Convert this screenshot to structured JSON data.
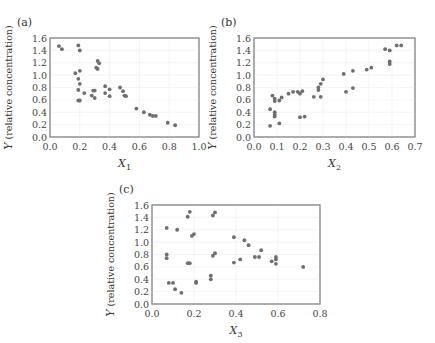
{
  "chart_data": [
    {
      "panel_label": "(a)",
      "type": "scatter",
      "title": "",
      "xlabel": "X",
      "xlabel_sub": "1",
      "ylabel": "Y (relative concentration)",
      "xlim": [
        0.0,
        1.0
      ],
      "ylim": [
        0.0,
        1.6
      ],
      "xticks": [
        "0.0",
        "0.2",
        "0.4",
        "0.6",
        "0.8",
        "1.0"
      ],
      "yticks": [
        "0.0",
        "0.2",
        "0.4",
        "0.6",
        "0.8",
        "1.0",
        "1.2",
        "1.4",
        "1.6"
      ],
      "grid": true,
      "points": [
        [
          0.06,
          1.47
        ],
        [
          0.08,
          1.42
        ],
        [
          0.19,
          1.48
        ],
        [
          0.2,
          1.4
        ],
        [
          0.17,
          1.03
        ],
        [
          0.2,
          1.07
        ],
        [
          0.19,
          0.94
        ],
        [
          0.2,
          0.86
        ],
        [
          0.19,
          0.76
        ],
        [
          0.19,
          0.59
        ],
        [
          0.2,
          0.59
        ],
        [
          0.23,
          0.71
        ],
        [
          0.31,
          1.12
        ],
        [
          0.32,
          1.1
        ],
        [
          0.32,
          1.23
        ],
        [
          0.33,
          1.19
        ],
        [
          0.28,
          0.67
        ],
        [
          0.29,
          0.75
        ],
        [
          0.3,
          0.75
        ],
        [
          0.3,
          0.63
        ],
        [
          0.37,
          0.82
        ],
        [
          0.37,
          0.71
        ],
        [
          0.4,
          0.77
        ],
        [
          0.4,
          0.66
        ],
        [
          0.47,
          0.8
        ],
        [
          0.49,
          0.74
        ],
        [
          0.5,
          0.67
        ],
        [
          0.51,
          0.66
        ],
        [
          0.58,
          0.46
        ],
        [
          0.63,
          0.4
        ],
        [
          0.67,
          0.36
        ],
        [
          0.69,
          0.34
        ],
        [
          0.71,
          0.34
        ],
        [
          0.79,
          0.23
        ],
        [
          0.84,
          0.19
        ]
      ]
    },
    {
      "panel_label": "(b)",
      "type": "scatter",
      "title": "",
      "xlabel": "X",
      "xlabel_sub": "2",
      "ylabel": "Y (relative concentration)",
      "xlim": [
        0.0,
        0.7
      ],
      "ylim": [
        0.0,
        1.6
      ],
      "xticks": [
        "0.0",
        "0.1",
        "0.2",
        "0.3",
        "0.4",
        "0.5",
        "0.6",
        "0.7"
      ],
      "yticks": [
        "0.0",
        "0.2",
        "0.4",
        "0.6",
        "0.8",
        "1.0",
        "1.2",
        "1.4",
        "1.6"
      ],
      "grid": true,
      "points": [
        [
          0.07,
          0.45
        ],
        [
          0.07,
          0.18
        ],
        [
          0.08,
          0.67
        ],
        [
          0.09,
          0.62
        ],
        [
          0.09,
          0.58
        ],
        [
          0.09,
          0.4
        ],
        [
          0.09,
          0.36
        ],
        [
          0.09,
          0.33
        ],
        [
          0.11,
          0.59
        ],
        [
          0.12,
          0.64
        ],
        [
          0.11,
          0.22
        ],
        [
          0.15,
          0.7
        ],
        [
          0.17,
          0.73
        ],
        [
          0.19,
          0.73
        ],
        [
          0.2,
          0.7
        ],
        [
          0.21,
          0.74
        ],
        [
          0.2,
          0.32
        ],
        [
          0.22,
          0.33
        ],
        [
          0.26,
          0.65
        ],
        [
          0.28,
          0.76
        ],
        [
          0.28,
          0.8
        ],
        [
          0.29,
          0.86
        ],
        [
          0.29,
          0.65
        ],
        [
          0.3,
          0.93
        ],
        [
          0.39,
          1.02
        ],
        [
          0.4,
          0.73
        ],
        [
          0.43,
          1.07
        ],
        [
          0.43,
          0.79
        ],
        [
          0.49,
          1.09
        ],
        [
          0.51,
          1.12
        ],
        [
          0.57,
          1.42
        ],
        [
          0.59,
          1.4
        ],
        [
          0.59,
          1.22
        ],
        [
          0.59,
          1.18
        ],
        [
          0.62,
          1.48
        ],
        [
          0.64,
          1.48
        ]
      ]
    },
    {
      "panel_label": "(c)",
      "type": "scatter",
      "title": "",
      "xlabel": "X",
      "xlabel_sub": "3",
      "ylabel": "Y (relative concentration)",
      "xlim": [
        0.0,
        0.8
      ],
      "ylim": [
        0.0,
        1.6
      ],
      "xticks": [
        "0.0",
        "0.2",
        "0.4",
        "0.6",
        "0.8"
      ],
      "yticks": [
        "0.0",
        "0.2",
        "0.4",
        "0.6",
        "0.8",
        "1.0",
        "1.2",
        "1.4",
        "1.6"
      ],
      "grid": true,
      "points": [
        [
          0.07,
          1.23
        ],
        [
          0.07,
          0.8
        ],
        [
          0.07,
          0.74
        ],
        [
          0.08,
          0.34
        ],
        [
          0.1,
          0.34
        ],
        [
          0.11,
          0.24
        ],
        [
          0.12,
          1.2
        ],
        [
          0.14,
          0.18
        ],
        [
          0.17,
          1.41
        ],
        [
          0.18,
          1.49
        ],
        [
          0.17,
          0.66
        ],
        [
          0.18,
          0.66
        ],
        [
          0.19,
          1.1
        ],
        [
          0.2,
          1.13
        ],
        [
          0.21,
          0.36
        ],
        [
          0.21,
          0.34
        ],
        [
          0.28,
          0.46
        ],
        [
          0.28,
          0.4
        ],
        [
          0.29,
          1.43
        ],
        [
          0.3,
          1.48
        ],
        [
          0.29,
          0.78
        ],
        [
          0.3,
          0.82
        ],
        [
          0.39,
          1.08
        ],
        [
          0.39,
          0.67
        ],
        [
          0.42,
          0.72
        ],
        [
          0.44,
          1.03
        ],
        [
          0.46,
          0.95
        ],
        [
          0.49,
          0.76
        ],
        [
          0.51,
          0.76
        ],
        [
          0.52,
          0.87
        ],
        [
          0.57,
          0.69
        ],
        [
          0.59,
          0.76
        ],
        [
          0.59,
          0.72
        ],
        [
          0.59,
          0.65
        ],
        [
          0.72,
          0.6
        ]
      ]
    }
  ],
  "panels": {
    "a": {
      "label": "(a)",
      "xlabel": "X",
      "xsub": "1",
      "ylabel": "Y (relative concentration)"
    },
    "b": {
      "label": "(b)",
      "xlabel": "X",
      "xsub": "2",
      "ylabel": "Y (relative concentration)"
    },
    "c": {
      "label": "(c)",
      "xlabel": "X",
      "xsub": "3",
      "ylabel": "Y (relative concentration)"
    }
  },
  "colors": {
    "point": "#6e6e6e",
    "frame": "#888888",
    "grid": "#ececec"
  }
}
